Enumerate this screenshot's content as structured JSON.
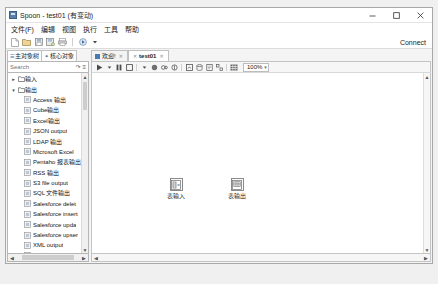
{
  "window": {
    "title": "Spoon - test01 (有变动)",
    "icon": "app-icon",
    "minimize": "─",
    "maximize": "□",
    "close": "✕"
  },
  "menubar": {
    "items": [
      {
        "label": "文件(F)"
      },
      {
        "label": "编辑"
      },
      {
        "label": "视图"
      },
      {
        "label": "执行"
      },
      {
        "label": "工具"
      },
      {
        "label": "帮助"
      }
    ]
  },
  "toolbar": {
    "connect_label": "Connect",
    "buttons": [
      {
        "name": "new-file-icon"
      },
      {
        "name": "open-file-icon"
      },
      {
        "name": "save-icon"
      },
      {
        "name": "save-as-icon"
      },
      {
        "name": "print-icon"
      },
      {
        "name": "run-icon"
      },
      {
        "name": "dropdown-icon"
      }
    ]
  },
  "sidebar": {
    "tabs": [
      {
        "label": "主对象树",
        "icon": "tree-icon"
      },
      {
        "label": "核心对象",
        "icon": "star-icon"
      }
    ],
    "search": {
      "value": "",
      "placeholder": "Search"
    },
    "search_tools": [
      {
        "name": "expand-all-icon"
      },
      {
        "name": "collapse-all-icon"
      }
    ],
    "tree": [
      {
        "label": "输入",
        "type": "folder",
        "expanded": false,
        "twist": "▸"
      },
      {
        "label": "输出",
        "type": "folder",
        "expanded": true,
        "twist": "▾"
      },
      {
        "label": "Access 输出",
        "type": "leaf"
      },
      {
        "label": "Cube输出",
        "type": "leaf"
      },
      {
        "label": "Excel输出",
        "type": "leaf"
      },
      {
        "label": "JSON output",
        "type": "leaf"
      },
      {
        "label": "LDAP 输出",
        "type": "leaf"
      },
      {
        "label": "Microsoft Excel",
        "type": "leaf"
      },
      {
        "label": "Pentaho 报表输出",
        "type": "leaf"
      },
      {
        "label": "RSS 输出",
        "type": "leaf"
      },
      {
        "label": "S3 file output",
        "type": "leaf"
      },
      {
        "label": "SQL 文件输出",
        "type": "leaf"
      },
      {
        "label": "Salesforce delet",
        "type": "leaf"
      },
      {
        "label": "Salesforce insert",
        "type": "leaf"
      },
      {
        "label": "Salesforce upda",
        "type": "leaf"
      },
      {
        "label": "Salesforce upser",
        "type": "leaf"
      },
      {
        "label": "XML output",
        "type": "leaf"
      },
      {
        "label": "删除",
        "type": "leaf"
      },
      {
        "label": "插入 / 更新",
        "type": "leaf"
      },
      {
        "label": "数据同步",
        "type": "leaf"
      },
      {
        "label": "文本文件输出",
        "type": "leaf"
      },
      {
        "label": "更新",
        "type": "leaf"
      },
      {
        "label": "自动文档输出",
        "type": "leaf"
      },
      {
        "label": "表输出",
        "type": "leaf",
        "selected": true
      }
    ]
  },
  "main": {
    "tabs": [
      {
        "label": "欢迎!",
        "active": false,
        "closable": true
      },
      {
        "label": "test01",
        "active": true,
        "closable": true
      }
    ],
    "canvas_toolbar": {
      "zoom": "100%",
      "zoom_caret": "▾",
      "buttons": [
        {
          "name": "run-transformation-icon"
        },
        {
          "name": "run-options-icon"
        },
        {
          "name": "pause-icon"
        },
        {
          "name": "stop-icon"
        },
        {
          "name": "preview-icon"
        },
        {
          "name": "debug-icon"
        },
        {
          "name": "replay-icon"
        },
        {
          "name": "verify-icon"
        },
        {
          "name": "analyze-icon"
        },
        {
          "name": "sql-icon"
        },
        {
          "name": "show-log-icon"
        },
        {
          "name": "arrange-icon"
        },
        {
          "name": "grid-icon"
        }
      ]
    },
    "canvas": {
      "nodes": [
        {
          "label": "表输入",
          "icon": "table-input-icon",
          "x": 175,
          "y": 175
        },
        {
          "label": "表输出",
          "icon": "table-output-icon",
          "x": 236,
          "y": 175
        }
      ]
    }
  }
}
